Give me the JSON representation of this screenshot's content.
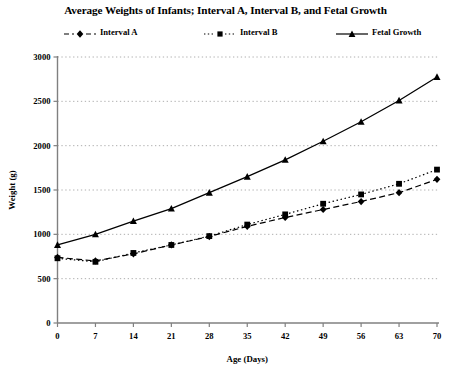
{
  "chart_data": {
    "type": "line",
    "title": "Average Weights of Infants; Interval A, Interval B, and Fetal Growth",
    "xlabel": "Age (Days)",
    "ylabel": "Weight (g)",
    "x": [
      0,
      7,
      14,
      21,
      28,
      35,
      42,
      49,
      56,
      63,
      70
    ],
    "xticklabels": [
      "0",
      "7",
      "14",
      "21",
      "28",
      "35",
      "42",
      "49",
      "56",
      "63",
      "70"
    ],
    "yticklabels": [
      "0",
      "500",
      "1000",
      "1500",
      "2000",
      "2500",
      "3000"
    ],
    "yticks": [
      0,
      500,
      1000,
      1500,
      2000,
      2500,
      3000
    ],
    "xlim": [
      0,
      70
    ],
    "ylim": [
      0,
      3000
    ],
    "grid": "horizontal-dotted",
    "legend_position": "top",
    "series": [
      {
        "name": "Interval A",
        "marker": "diamond",
        "linestyle": "dashed",
        "color": "#000000",
        "values": [
          740,
          700,
          780,
          880,
          975,
          1090,
          1190,
          1280,
          1370,
          1470,
          1620
        ]
      },
      {
        "name": "Interval B",
        "marker": "square",
        "linestyle": "dotted",
        "color": "#000000",
        "values": [
          730,
          690,
          790,
          880,
          980,
          1110,
          1225,
          1345,
          1450,
          1570,
          1730
        ]
      },
      {
        "name": "Fetal Growth",
        "marker": "triangle",
        "linestyle": "solid",
        "color": "#000000",
        "values": [
          880,
          1000,
          1150,
          1290,
          1470,
          1650,
          1840,
          2050,
          2270,
          2510,
          2775
        ]
      }
    ]
  },
  "colors": {
    "axis": "#808080",
    "grid": "#999999",
    "ink": "#000000",
    "background": "#ffffff"
  }
}
